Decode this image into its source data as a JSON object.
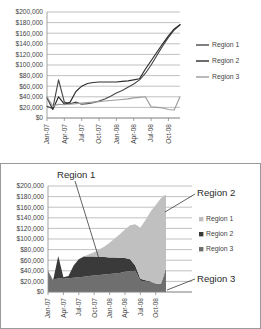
{
  "chart_data": [
    {
      "id": "top",
      "type": "line",
      "title": "",
      "xlabel": "",
      "ylabel": "",
      "ylim": [
        0,
        200000
      ],
      "ytick_labels": [
        "$0",
        "$20,000",
        "$40,000",
        "$60,000",
        "$80,000",
        "$100,000",
        "$120,000",
        "$140,000",
        "$160,000",
        "$180,000",
        "$200,000"
      ],
      "ytick_values": [
        0,
        20000,
        40000,
        60000,
        80000,
        100000,
        120000,
        140000,
        160000,
        180000,
        200000
      ],
      "grid": true,
      "legend_position": "right",
      "categories": [
        "Jan-07",
        "Feb-07",
        "Mar-07",
        "Apr-07",
        "May-07",
        "Jun-07",
        "Jul-07",
        "Aug-07",
        "Sep-07",
        "Oct-07",
        "Nov-07",
        "Dec-07",
        "Jan-08",
        "Feb-08",
        "Mar-08",
        "Apr-08",
        "May-08",
        "Jun-08",
        "Jul-08",
        "Aug-08",
        "Sep-08",
        "Oct-08",
        "Nov-08",
        "Dec-08"
      ],
      "tick_labels": [
        "Jan-07",
        "Apr-07",
        "Jul-07",
        "Oct-07",
        "Jan-08",
        "Apr-08",
        "Jul-08",
        "Oct-08"
      ],
      "series": [
        {
          "name": "Region 1",
          "color": "#4a4a4a",
          "values": [
            22000,
            18000,
            72000,
            30000,
            27000,
            30000,
            26000,
            27000,
            29000,
            32000,
            36000,
            41000,
            47000,
            52000,
            58000,
            64000,
            72000,
            84000,
            100000,
            118000,
            136000,
            152000,
            166000,
            176000
          ]
        },
        {
          "name": "Region 2",
          "color": "#2d2d2d",
          "values": [
            38000,
            16000,
            40000,
            26000,
            30000,
            50000,
            60000,
            65000,
            67000,
            68000,
            68000,
            68000,
            68000,
            69000,
            70000,
            72000,
            74000,
            92000,
            108000,
            124000,
            140000,
            155000,
            168000,
            176000
          ]
        },
        {
          "name": "Region 3",
          "color": "#9d9d9d",
          "values": [
            40000,
            22000,
            26000,
            25000,
            26000,
            27000,
            28000,
            29000,
            30000,
            31000,
            32000,
            33000,
            34000,
            35000,
            36000,
            38000,
            39000,
            40000,
            21000,
            20000,
            19000,
            16000,
            15000,
            40000
          ]
        }
      ]
    },
    {
      "id": "bottom",
      "type": "area",
      "stacked": true,
      "title": "",
      "xlabel": "",
      "ylabel": "",
      "ylim": [
        0,
        200000
      ],
      "ytick_labels": [
        "$0",
        "$20,000",
        "$40,000",
        "$60,000",
        "$80,000",
        "$100,000",
        "$120,000",
        "$140,000",
        "$160,000",
        "$180,000",
        "$200,000"
      ],
      "ytick_values": [
        0,
        20000,
        40000,
        60000,
        80000,
        100000,
        120000,
        140000,
        160000,
        180000,
        200000
      ],
      "grid": true,
      "legend_position": "right",
      "categories": [
        "Jan-07",
        "Feb-07",
        "Mar-07",
        "Apr-07",
        "May-07",
        "Jun-07",
        "Jul-07",
        "Aug-07",
        "Sep-07",
        "Oct-07",
        "Nov-07",
        "Dec-07",
        "Jan-08",
        "Feb-08",
        "Mar-08",
        "Apr-08",
        "May-08",
        "Jun-08",
        "Jul-08",
        "Aug-08",
        "Sep-08",
        "Oct-08",
        "Nov-08",
        "Dec-08"
      ],
      "tick_labels": [
        "Jan-07",
        "Apr-07",
        "Jul-07",
        "Oct-07",
        "Jan-08",
        "Apr-08",
        "Jul-08",
        "Oct-08"
      ],
      "series": [
        {
          "name": "Region 3",
          "color": "#6f6f6f",
          "values": [
            40000,
            22000,
            26000,
            25000,
            26000,
            27000,
            28000,
            29000,
            30000,
            31000,
            32000,
            33000,
            34000,
            35000,
            36000,
            38000,
            39000,
            40000,
            21000,
            20000,
            19000,
            16000,
            15000,
            40000
          ]
        },
        {
          "name": "Region 2",
          "color": "#3a3a3a",
          "values": [
            0,
            0,
            42000,
            3000,
            4000,
            23000,
            34000,
            38000,
            37000,
            36000,
            34000,
            33000,
            31000,
            30000,
            28000,
            26000,
            23000,
            10000,
            4000,
            2000,
            1000,
            0,
            0,
            4000
          ]
        },
        {
          "name": "Region 1",
          "color": "#c0c0c0",
          "values": [
            0,
            0,
            0,
            0,
            0,
            0,
            0,
            0,
            4000,
            8000,
            14000,
            20000,
            28000,
            36000,
            45000,
            54000,
            64000,
            78000,
            96000,
            114000,
            132000,
            148000,
            162000,
            140000
          ]
        }
      ],
      "callouts": [
        {
          "label": "Region 1",
          "anchor": "top-left"
        },
        {
          "label": "Region 2",
          "anchor": "right-upper"
        },
        {
          "label": "Region 3",
          "anchor": "right-lower"
        }
      ]
    }
  ],
  "top_chart": {
    "legend": [
      {
        "label": "Region 1"
      },
      {
        "label": "Region 2"
      },
      {
        "label": "Region 3"
      }
    ]
  },
  "bottom_chart": {
    "legend": [
      {
        "label": "Region 1"
      },
      {
        "label": "Region 2"
      },
      {
        "label": "Region 3"
      }
    ],
    "callout_region1": "Region 1",
    "callout_region2": "Region 2",
    "callout_region3": "Region 3"
  }
}
